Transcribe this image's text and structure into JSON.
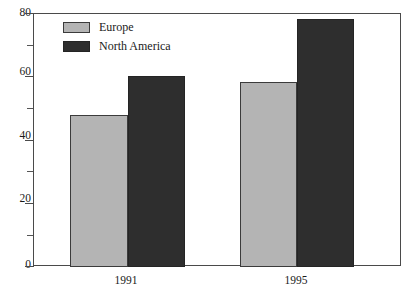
{
  "chart_data": {
    "type": "bar",
    "title": "",
    "subtitle": "",
    "xlabel": "",
    "ylabel": "",
    "categories": [
      "1991",
      "1995"
    ],
    "series": [
      {
        "name": "Europe",
        "color": "#b4b4b4",
        "values": [
          48,
          58.5
        ]
      },
      {
        "name": "North America",
        "color": "#2e2e2e",
        "values": [
          60.5,
          78.5
        ]
      }
    ],
    "ylim": [
      0,
      80
    ],
    "y_major_ticks": [
      0,
      20,
      40,
      60,
      80
    ],
    "y_minor_ticks": [
      10,
      30,
      50,
      70
    ],
    "y_tick_labels": [
      "0",
      "20",
      "40",
      "60",
      "80"
    ],
    "grid": false,
    "legend_position": "top-left",
    "frame": true
  },
  "legend": {
    "entries": [
      {
        "label": "Europe",
        "swatch": "europe"
      },
      {
        "label": "North America",
        "swatch": "northamerica"
      }
    ]
  },
  "axis": {
    "y_labels": [
      "80",
      "60",
      "40",
      "20",
      "0"
    ],
    "x_labels": [
      "1991",
      "1995"
    ]
  }
}
